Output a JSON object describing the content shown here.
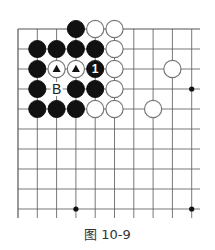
{
  "caption": "图 10-9",
  "board": {
    "origin_x": 18,
    "origin_y": 29,
    "spacing_x": 19.3,
    "spacing_y": 20,
    "cols": 10,
    "rows": 10,
    "line_extend_right": 200,
    "line_extend_bottom": 218,
    "line_color": "#555555",
    "top_edge": true,
    "left_edge": true,
    "star_points": [
      [
        9,
        3
      ],
      [
        9,
        9
      ],
      [
        3,
        9
      ]
    ],
    "stones": [
      {
        "col": 3,
        "row": 0,
        "color": "black"
      },
      {
        "col": 4,
        "row": 0,
        "color": "white"
      },
      {
        "col": 5,
        "row": 0,
        "color": "white"
      },
      {
        "col": 1,
        "row": 1,
        "color": "black"
      },
      {
        "col": 2,
        "row": 1,
        "color": "black"
      },
      {
        "col": 3,
        "row": 1,
        "color": "black"
      },
      {
        "col": 4,
        "row": 1,
        "color": "black"
      },
      {
        "col": 5,
        "row": 1,
        "color": "white"
      },
      {
        "col": 1,
        "row": 2,
        "color": "black"
      },
      {
        "col": 2,
        "row": 2,
        "color": "white",
        "mark": "triangle"
      },
      {
        "col": 3,
        "row": 2,
        "color": "white",
        "mark": "triangle"
      },
      {
        "col": 4,
        "row": 2,
        "color": "black",
        "label": "1"
      },
      {
        "col": 5,
        "row": 2,
        "color": "white"
      },
      {
        "col": 8,
        "row": 2,
        "color": "white"
      },
      {
        "col": 1,
        "row": 3,
        "color": "black"
      },
      {
        "col": 3,
        "row": 3,
        "color": "black"
      },
      {
        "col": 4,
        "row": 3,
        "color": "black"
      },
      {
        "col": 5,
        "row": 3,
        "color": "white"
      },
      {
        "col": 1,
        "row": 4,
        "color": "black"
      },
      {
        "col": 2,
        "row": 4,
        "color": "black"
      },
      {
        "col": 3,
        "row": 4,
        "color": "black"
      },
      {
        "col": 4,
        "row": 4,
        "color": "white"
      },
      {
        "col": 5,
        "row": 4,
        "color": "white"
      },
      {
        "col": 7,
        "row": 4,
        "color": "white"
      }
    ],
    "labels": [
      {
        "col": 2,
        "row": 3,
        "text": "B"
      }
    ]
  }
}
